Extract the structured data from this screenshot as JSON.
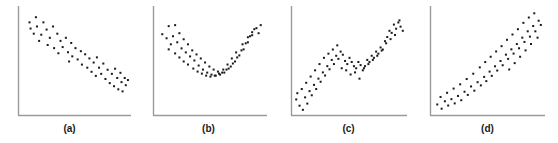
{
  "figure": {
    "panel_count": 4,
    "marker_color": "#1a1a1a",
    "axis_color": "#9a9a9a",
    "background_color": "#ffffff",
    "marker_shape": "square",
    "marker_size_px": 2
  },
  "panels": [
    {
      "id": "a",
      "caption": "(a)",
      "chart_data": {
        "type": "scatter",
        "title": "",
        "xlabel": "",
        "ylabel": "",
        "xlim": [
          0,
          100
        ],
        "ylim": [
          0,
          100
        ],
        "grid": false,
        "legend": "none",
        "relationship": "strong negative linear",
        "points": [
          [
            7,
            88
          ],
          [
            13,
            93
          ],
          [
            8,
            82
          ],
          [
            14,
            84
          ],
          [
            20,
            88
          ],
          [
            11,
            77
          ],
          [
            18,
            76
          ],
          [
            23,
            81
          ],
          [
            26,
            73
          ],
          [
            29,
            84
          ],
          [
            16,
            70
          ],
          [
            33,
            77
          ],
          [
            24,
            66
          ],
          [
            36,
            70
          ],
          [
            30,
            63
          ],
          [
            41,
            73
          ],
          [
            38,
            64
          ],
          [
            46,
            68
          ],
          [
            34,
            58
          ],
          [
            43,
            59
          ],
          [
            50,
            63
          ],
          [
            47,
            55
          ],
          [
            55,
            60
          ],
          [
            52,
            52
          ],
          [
            59,
            57
          ],
          [
            44,
            50
          ],
          [
            56,
            47
          ],
          [
            63,
            53
          ],
          [
            61,
            44
          ],
          [
            67,
            49
          ],
          [
            70,
            54
          ],
          [
            65,
            40
          ],
          [
            72,
            44
          ],
          [
            76,
            48
          ],
          [
            69,
            36
          ],
          [
            74,
            38
          ],
          [
            80,
            42
          ],
          [
            78,
            33
          ],
          [
            84,
            38
          ],
          [
            87,
            43
          ],
          [
            82,
            29
          ],
          [
            89,
            34
          ],
          [
            92,
            39
          ],
          [
            86,
            26
          ],
          [
            93,
            30
          ],
          [
            96,
            34
          ],
          [
            90,
            23
          ],
          [
            97,
            27
          ],
          [
            99,
            32
          ],
          [
            94,
            21
          ]
        ]
      }
    },
    {
      "id": "b",
      "caption": "(b)",
      "chart_data": {
        "type": "scatter",
        "title": "",
        "xlabel": "",
        "ylabel": "",
        "xlim": [
          0,
          100
        ],
        "ylim": [
          0,
          100
        ],
        "grid": false,
        "legend": "none",
        "relationship": "u-shaped quadratic",
        "points": [
          [
            4,
            78
          ],
          [
            10,
            86
          ],
          [
            16,
            87
          ],
          [
            8,
            74
          ],
          [
            14,
            76
          ],
          [
            20,
            79
          ],
          [
            12,
            68
          ],
          [
            18,
            70
          ],
          [
            24,
            73
          ],
          [
            10,
            63
          ],
          [
            22,
            64
          ],
          [
            28,
            68
          ],
          [
            16,
            59
          ],
          [
            26,
            60
          ],
          [
            32,
            62
          ],
          [
            20,
            55
          ],
          [
            30,
            56
          ],
          [
            36,
            58
          ],
          [
            24,
            51
          ],
          [
            34,
            52
          ],
          [
            40,
            54
          ],
          [
            28,
            48
          ],
          [
            38,
            47
          ],
          [
            44,
            50
          ],
          [
            33,
            44
          ],
          [
            42,
            43
          ],
          [
            48,
            46
          ],
          [
            37,
            41
          ],
          [
            46,
            40
          ],
          [
            52,
            43
          ],
          [
            41,
            39
          ],
          [
            50,
            38
          ],
          [
            56,
            41
          ],
          [
            45,
            37
          ],
          [
            54,
            37
          ],
          [
            60,
            40
          ],
          [
            49,
            36
          ],
          [
            58,
            38
          ],
          [
            64,
            43
          ],
          [
            53,
            37
          ],
          [
            62,
            40
          ],
          [
            68,
            46
          ],
          [
            57,
            39
          ],
          [
            66,
            44
          ],
          [
            72,
            51
          ],
          [
            61,
            43
          ],
          [
            70,
            49
          ],
          [
            76,
            57
          ],
          [
            65,
            48
          ],
          [
            74,
            55
          ],
          [
            80,
            63
          ],
          [
            69,
            54
          ],
          [
            78,
            62
          ],
          [
            84,
            70
          ],
          [
            73,
            60
          ],
          [
            82,
            69
          ],
          [
            88,
            77
          ],
          [
            79,
            68
          ],
          [
            86,
            76
          ],
          [
            92,
            84
          ],
          [
            84,
            75
          ],
          [
            90,
            83
          ],
          [
            96,
            87
          ],
          [
            88,
            80
          ],
          [
            94,
            79
          ]
        ]
      }
    },
    {
      "id": "c",
      "caption": "(c)",
      "chart_data": {
        "type": "scatter",
        "title": "",
        "xlabel": "",
        "ylabel": "",
        "xlim": [
          0,
          100
        ],
        "ylim": [
          0,
          100
        ],
        "grid": false,
        "legend": "none",
        "relationship": "non-monotonic increasing with plateau",
        "points": [
          [
            2,
            14
          ],
          [
            5,
            8
          ],
          [
            3,
            20
          ],
          [
            8,
            4
          ],
          [
            10,
            16
          ],
          [
            7,
            24
          ],
          [
            12,
            10
          ],
          [
            14,
            22
          ],
          [
            11,
            30
          ],
          [
            16,
            18
          ],
          [
            18,
            28
          ],
          [
            15,
            36
          ],
          [
            20,
            24
          ],
          [
            22,
            34
          ],
          [
            19,
            42
          ],
          [
            24,
            31
          ],
          [
            26,
            40
          ],
          [
            23,
            48
          ],
          [
            28,
            37
          ],
          [
            30,
            46
          ],
          [
            27,
            54
          ],
          [
            32,
            43
          ],
          [
            34,
            52
          ],
          [
            31,
            58
          ],
          [
            36,
            48
          ],
          [
            38,
            56
          ],
          [
            35,
            62
          ],
          [
            40,
            53
          ],
          [
            42,
            60
          ],
          [
            39,
            66
          ],
          [
            44,
            57
          ],
          [
            46,
            51
          ],
          [
            43,
            44
          ],
          [
            48,
            48
          ],
          [
            50,
            54
          ],
          [
            47,
            42
          ],
          [
            52,
            50
          ],
          [
            54,
            46
          ],
          [
            51,
            38
          ],
          [
            56,
            44
          ],
          [
            58,
            50
          ],
          [
            55,
            40
          ],
          [
            60,
            47
          ],
          [
            62,
            42
          ],
          [
            59,
            34
          ],
          [
            64,
            46
          ],
          [
            66,
            52
          ],
          [
            63,
            44
          ],
          [
            68,
            50
          ],
          [
            70,
            56
          ],
          [
            67,
            48
          ],
          [
            72,
            54
          ],
          [
            74,
            60
          ],
          [
            71,
            52
          ],
          [
            76,
            58
          ],
          [
            78,
            64
          ],
          [
            75,
            56
          ],
          [
            80,
            62
          ],
          [
            82,
            70
          ],
          [
            79,
            61
          ],
          [
            84,
            74
          ],
          [
            86,
            80
          ],
          [
            83,
            68
          ],
          [
            88,
            78
          ],
          [
            90,
            86
          ],
          [
            87,
            72
          ],
          [
            92,
            82
          ],
          [
            94,
            88
          ],
          [
            91,
            76
          ],
          [
            96,
            84
          ],
          [
            98,
            80
          ],
          [
            95,
            90
          ]
        ]
      }
    },
    {
      "id": "d",
      "caption": "(d)",
      "chart_data": {
        "type": "scatter",
        "title": "",
        "xlabel": "",
        "ylabel": "",
        "xlim": [
          0,
          100
        ],
        "ylim": [
          0,
          100
        ],
        "grid": false,
        "legend": "none",
        "relationship": "positive increasing / exponential",
        "points": [
          [
            3,
            9
          ],
          [
            7,
            5
          ],
          [
            10,
            12
          ],
          [
            6,
            16
          ],
          [
            13,
            8
          ],
          [
            16,
            14
          ],
          [
            12,
            20
          ],
          [
            19,
            10
          ],
          [
            22,
            17
          ],
          [
            18,
            24
          ],
          [
            25,
            13
          ],
          [
            28,
            21
          ],
          [
            24,
            28
          ],
          [
            31,
            18
          ],
          [
            34,
            26
          ],
          [
            30,
            33
          ],
          [
            37,
            22
          ],
          [
            40,
            30
          ],
          [
            36,
            38
          ],
          [
            43,
            27
          ],
          [
            46,
            35
          ],
          [
            42,
            44
          ],
          [
            48,
            31
          ],
          [
            51,
            40
          ],
          [
            47,
            49
          ],
          [
            53,
            36
          ],
          [
            56,
            45
          ],
          [
            52,
            54
          ],
          [
            58,
            41
          ],
          [
            61,
            50
          ],
          [
            57,
            59
          ],
          [
            63,
            46
          ],
          [
            66,
            56
          ],
          [
            62,
            64
          ],
          [
            68,
            52
          ],
          [
            71,
            61
          ],
          [
            67,
            70
          ],
          [
            73,
            57
          ],
          [
            76,
            66
          ],
          [
            72,
            75
          ],
          [
            78,
            62
          ],
          [
            81,
            72
          ],
          [
            77,
            80
          ],
          [
            83,
            68
          ],
          [
            86,
            78
          ],
          [
            82,
            86
          ],
          [
            88,
            73
          ],
          [
            91,
            83
          ],
          [
            87,
            91
          ],
          [
            93,
            78
          ],
          [
            96,
            88
          ],
          [
            92,
            95
          ],
          [
            98,
            84
          ],
          [
            95,
            72
          ],
          [
            89,
            66
          ],
          [
            84,
            60
          ],
          [
            79,
            54
          ],
          [
            74,
            48
          ],
          [
            69,
            42
          ]
        ]
      }
    }
  ]
}
